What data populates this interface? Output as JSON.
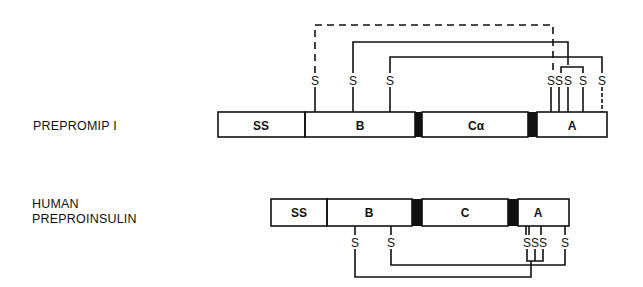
{
  "diagram": {
    "top": {
      "name": "PREPROMIP I",
      "segments": [
        {
          "label": "SS",
          "x1": 218,
          "x2": 305,
          "type": "box"
        },
        {
          "label": "B",
          "x1": 305,
          "x2": 415,
          "type": "box"
        },
        {
          "label": "",
          "x1": 415,
          "x2": 422,
          "type": "cleavage"
        },
        {
          "label": "Cα",
          "x1": 422,
          "x2": 528,
          "type": "box"
        },
        {
          "label": "",
          "x1": 528,
          "x2": 537,
          "type": "cleavage"
        },
        {
          "label": "A",
          "x1": 537,
          "x2": 607,
          "type": "box"
        }
      ],
      "cysteines": [
        {
          "label": "S",
          "x": 315
        },
        {
          "label": "S",
          "x": 353
        },
        {
          "label": "S",
          "x": 390
        },
        {
          "label": "S",
          "x": 551
        },
        {
          "label": "S",
          "x": 559
        },
        {
          "label": "S",
          "x": 568
        },
        {
          "label": "S",
          "x": 583
        },
        {
          "label": "S",
          "x": 602
        }
      ],
      "bonds": [
        {
          "from": 315,
          "to": 553,
          "style": "dashed"
        },
        {
          "from": 353,
          "to": 568,
          "style": "solid"
        },
        {
          "from": 390,
          "to": 602,
          "style": "solid"
        },
        {
          "from": 561,
          "to": 583,
          "style": "solid"
        }
      ]
    },
    "bottom": {
      "name_line1": "HUMAN",
      "name_line2": "PREPROINSULIN",
      "segments": [
        {
          "label": "SS",
          "x1": 271,
          "x2": 327,
          "type": "box"
        },
        {
          "label": "B",
          "x1": 327,
          "x2": 412,
          "type": "box"
        },
        {
          "label": "",
          "x1": 412,
          "x2": 422,
          "type": "cleavage"
        },
        {
          "label": "C",
          "x1": 422,
          "x2": 508,
          "type": "box"
        },
        {
          "label": "",
          "x1": 508,
          "x2": 518,
          "type": "cleavage"
        },
        {
          "label": "A",
          "x1": 518,
          "x2": 569,
          "type": "box"
        }
      ],
      "cysteines": [
        {
          "label": "S",
          "x": 355
        },
        {
          "label": "S",
          "x": 391
        },
        {
          "label": "S",
          "x": 527
        },
        {
          "label": "S",
          "x": 535
        },
        {
          "label": "S",
          "x": 543
        },
        {
          "label": "S",
          "x": 565
        }
      ],
      "bonds": [
        {
          "from": 355,
          "to": 531,
          "style": "solid"
        },
        {
          "from": 391,
          "to": 565,
          "style": "solid"
        },
        {
          "from": 527,
          "to": 543,
          "style": "solid"
        }
      ]
    },
    "colors": {
      "ink": "#111111",
      "background": "#ffffff"
    }
  }
}
